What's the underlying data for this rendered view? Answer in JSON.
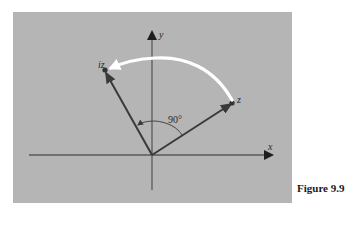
{
  "figure": {
    "caption": "Figure 9.9",
    "background_color": "#b4b4b4",
    "axes": {
      "x_label": "x",
      "y_label": "y"
    },
    "vectors": [
      {
        "name": "z",
        "label": "z"
      },
      {
        "name": "iz",
        "label": "iz"
      }
    ],
    "angle_label": "90°",
    "rotation_arc_color": "#ffffff",
    "vector_color": "#4a4a4a",
    "axis_color": "#5a5a5a"
  }
}
